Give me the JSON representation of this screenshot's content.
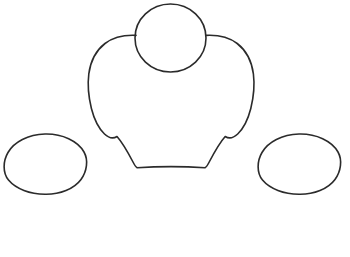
{
  "canvas": {
    "width": 350,
    "height": 257,
    "background_color": "#ffffff",
    "title": "Line drawing outline sketch"
  },
  "style": {
    "stroke_color": "#2b2b2b",
    "stroke_width": 1.6,
    "fill": "none"
  },
  "shapes": [
    {
      "name": "head-circle",
      "type": "circle",
      "label": "Head circle",
      "cx": 170.5,
      "cy": 38,
      "rx": 35.5,
      "ry": 34,
      "path": "M 170.5 4 C 190 4 206 19 206 38 C 206 57 190 72 170.5 72 C 151 72 135 57 135 38 C 135 19 151 4 170.5 4 Z"
    },
    {
      "name": "body-outline",
      "type": "closed-path",
      "label": "Body torso outline with shoulders and tapered base",
      "path": "M 136.0 35.4 C 124.0 34.8 113.0 37.5 105.0 43.5 C 96.0 50.5 90.5 61.0 88.8 74.0 C 87.4 85.0 88.6 97.0 91.4 108.5 C 94.2 119.5 98.8 128.5 104.5 134.0 C 108.5 137.8 112.8 139.2 117.0 136.5 C 121.5 141.5 128.0 152.5 133.0 162.0 C 134.5 165.0 135.8 167.0 137.2 167.8 C 148.0 167.0 160.0 166.6 171.0 166.6 C 182.0 166.6 194.0 167.0 205.0 167.8 C 206.4 167.0 207.7 165.0 209.2 162.0 C 214.2 152.5 220.7 141.5 225.2 136.5 C 229.4 139.2 233.7 137.8 237.7 134.0 C 243.4 128.5 248.0 119.5 250.8 108.5 C 253.6 97.0 254.8 85.0 253.4 74.0 C 251.7 61.0 246.2 50.5 237.2 43.5 C 229.2 37.5 218.2 34.8 206.2 35.4"
    },
    {
      "name": "left-oval",
      "type": "ellipse",
      "label": "Left oval shape",
      "cx": 45,
      "cy": 164,
      "rx": 41,
      "ry": 30,
      "path": "M 45 134 C 62 133.5 78 141 84 152 C 88.5 160 87 171 81 179.5 C 74 189 60 194.5 45 194.2 C 30 194 16 189 8.5 180 C 2.5 172.5 3.0 161 8.0 152.5 C 14.0 142 28 134.5 45 134 Z"
    },
    {
      "name": "right-oval",
      "type": "ellipse",
      "label": "Right oval shape",
      "cx": 299,
      "cy": 164,
      "rx": 41,
      "ry": 30,
      "path": "M 299 134 C 316 133.5 332 141 338 152 C 342.5 160 341 171 335 179.5 C 328 189 314 194.5 299 194.2 C 284 194 270 189 262.5 180 C 256.5 172.5 257.0 161 262.0 152.5 C 268.0 142 282 134.5 299 134 Z"
    }
  ]
}
